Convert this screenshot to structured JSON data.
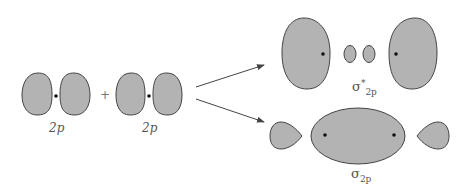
{
  "diagram": {
    "left_orbital_1": {
      "label": "2p"
    },
    "operator": "+",
    "left_orbital_2": {
      "label": "2p"
    },
    "antibonding": {
      "symbol": "σ",
      "superscript": "*",
      "subscript": "2p"
    },
    "bonding": {
      "symbol": "σ",
      "subscript": "2p"
    },
    "colors": {
      "lobe_fill": "#b3b3b3",
      "lobe_stroke": "#444444",
      "arrow": "#444444"
    }
  }
}
